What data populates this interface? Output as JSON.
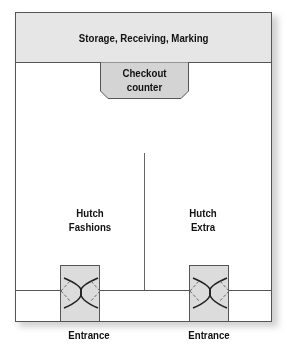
{
  "diagram": {
    "header_area": "Storage, Receiving, Marking",
    "checkout": {
      "line1": "Checkout",
      "line2": "counter"
    },
    "stores": [
      {
        "line1": "Hutch",
        "line2": "Fashions"
      },
      {
        "line1": "Hutch",
        "line2": "Extra"
      }
    ],
    "entrances": [
      {
        "label": "Entrance"
      },
      {
        "label": "Entrance"
      }
    ],
    "colors": {
      "fill": "#e6e6e6",
      "stroke": "#555555",
      "door_fill": "#dcdcdc"
    }
  }
}
